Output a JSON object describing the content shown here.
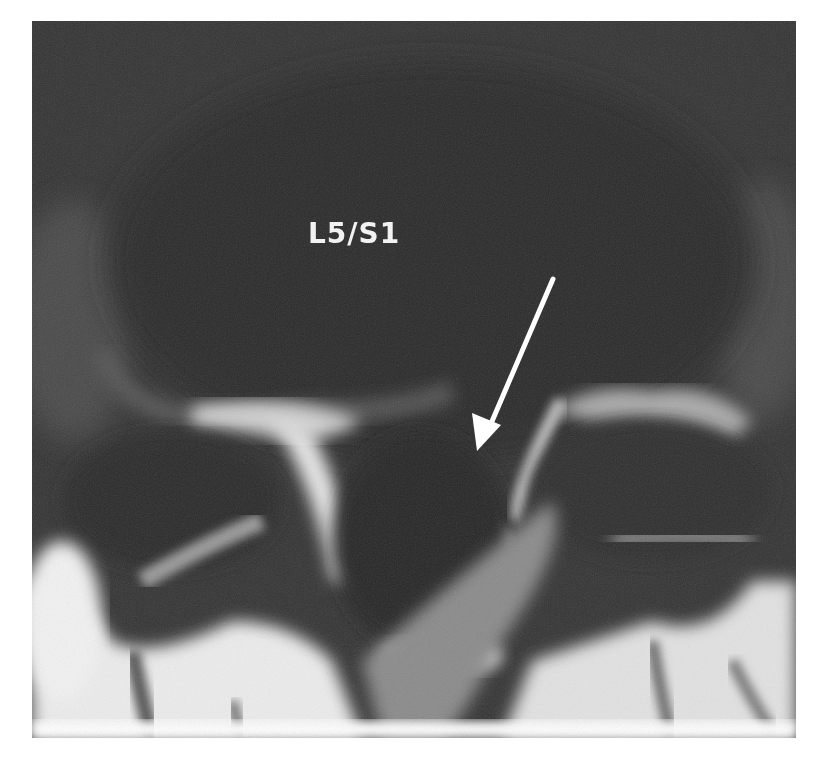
{
  "image": {
    "type": "Axial MRI of lumbar spine",
    "label": "L5/S1",
    "annotation": "arrow",
    "colors": {
      "background": "#ffffff",
      "dark_tissue": "#2e2e2e",
      "bright_tissue": "#f0f0f0",
      "arrow": "#ffffff"
    }
  }
}
